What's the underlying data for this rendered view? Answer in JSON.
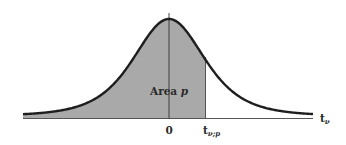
{
  "figure": {
    "type": "t-distribution density curve with left-tail shaded area",
    "colors": {
      "curve": "#1e1e1e",
      "shade": "#a9a9a9",
      "axis": "#555555",
      "background": "#ffffff"
    },
    "labels": {
      "area": "Area p",
      "area_main": "Area ",
      "area_var": "p",
      "origin": "0",
      "quantile_main": "t",
      "quantile_sub": "ν;p",
      "axis_main": "t",
      "axis_sub": "ν"
    }
  },
  "chart_data": {
    "type": "area",
    "title": "",
    "xlabel": "t_ν",
    "ylabel": "",
    "x_ticks": [
      "0",
      "t_ν;p"
    ],
    "shaded_region": {
      "from": "-inf",
      "to": "t_ν;p",
      "label": "Area p"
    },
    "grid": false,
    "legend": null
  }
}
